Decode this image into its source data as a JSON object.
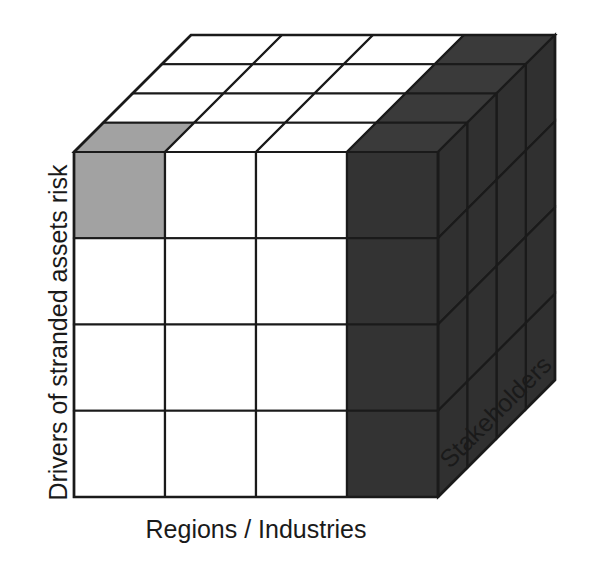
{
  "figure": {
    "title": "",
    "type": "3d-cube-framework-diagram",
    "axes": {
      "y_label": "Drivers of stranded assets risk",
      "x_label": "Regions / Industries",
      "z_label": "Stakeholders"
    },
    "colors": {
      "white_cell": "#ffffff",
      "light_gray_cell": "#a2a2a2",
      "dark_face": "#333333",
      "dark_side_face": "#303030",
      "dark_top_face": "#3a3a3a",
      "stroke": "#1a1a1a",
      "text": "#1a1a1a",
      "background": "#ffffff"
    },
    "grid": {
      "columns": 4,
      "rows": 4,
      "depth": 4
    },
    "front_face_cells": [
      [
        "light_gray",
        "white",
        "white",
        "dark"
      ],
      [
        "white",
        "white",
        "white",
        "dark"
      ],
      [
        "white",
        "white",
        "white",
        "dark"
      ],
      [
        "white",
        "white",
        "white",
        "dark"
      ]
    ],
    "top_face_cells": [
      [
        "white",
        "white",
        "white",
        "dark"
      ],
      [
        "white",
        "white",
        "white",
        "dark"
      ],
      [
        "white",
        "white",
        "white",
        "dark"
      ],
      [
        "light_gray",
        "white",
        "white",
        "dark"
      ]
    ],
    "right_face_cells": [
      [
        "dark",
        "dark",
        "dark",
        "dark"
      ],
      [
        "dark",
        "dark",
        "dark",
        "dark"
      ],
      [
        "dark",
        "dark",
        "dark",
        "dark"
      ],
      [
        "dark",
        "dark",
        "dark",
        "dark"
      ]
    ],
    "geometry": {
      "front_left_x": 74,
      "front_right_x": 438,
      "front_top_y": 152,
      "front_bottom_y": 497,
      "depth_dx": 117,
      "depth_dy": -117
    }
  }
}
